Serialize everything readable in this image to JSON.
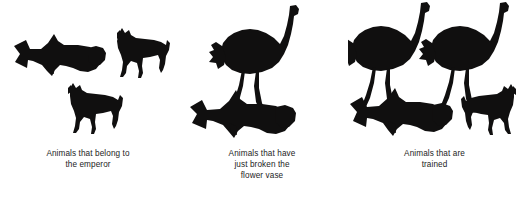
{
  "page": {
    "background_color": "#ffffff",
    "silhouette_color": "#100f0f",
    "caption_color": "#1c1c1c"
  },
  "groups": [
    {
      "id": "group-0",
      "caption_lines": [
        "Animals that belong to",
        "the emperor"
      ],
      "animals": [
        {
          "name": "hammerhead-shark",
          "facing": "right"
        },
        {
          "name": "horse",
          "facing": "left"
        },
        {
          "name": "horse",
          "facing": "left"
        }
      ]
    },
    {
      "id": "group-1",
      "caption_lines": [
        "Animals that have",
        "just broken the",
        "flower vase"
      ],
      "animals": [
        {
          "name": "ostrich",
          "facing": "right"
        },
        {
          "name": "hammerhead-shark",
          "facing": "right"
        }
      ]
    },
    {
      "id": "group-2",
      "caption_lines": [
        "Animals that are",
        "trained"
      ],
      "animals": [
        {
          "name": "ostrich",
          "facing": "right"
        },
        {
          "name": "ostrich",
          "facing": "right"
        },
        {
          "name": "hammerhead-shark",
          "facing": "right"
        },
        {
          "name": "horse",
          "facing": "right"
        }
      ]
    }
  ]
}
